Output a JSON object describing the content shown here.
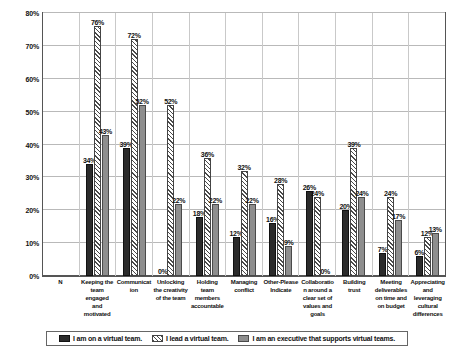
{
  "chart_data": {
    "type": "bar",
    "title": "",
    "xlabel": "",
    "ylabel": "",
    "ylim": [
      0,
      80
    ],
    "ytick_labels": [
      "0%",
      "10%",
      "20%",
      "30%",
      "40%",
      "50%",
      "60%",
      "70%",
      "80%"
    ],
    "ytick_values": [
      0,
      10,
      20,
      30,
      40,
      50,
      60,
      70,
      80
    ],
    "grid": true,
    "legend_position": "bottom",
    "value_suffix": "%",
    "categories": [
      "N",
      "Keeping the team engaged and motivated",
      "Communication",
      "Unlocking the creativity of the team",
      "Holding team members accountable",
      "Managing conflict",
      "Other-Please Indicate",
      "Collaboration around a clear set of values and goals",
      "Building trust",
      "Meeting deliverables on time and on budget",
      "Appreciating and leveraging cultural differences"
    ],
    "series": [
      {
        "name": "I am on a virtual team.",
        "pattern": "solid-dark",
        "values": [
          null,
          34,
          39,
          0,
          18,
          12,
          16,
          26,
          20,
          7,
          6
        ],
        "labels": [
          "",
          "34%",
          "39%",
          "0%",
          "18%",
          "12%",
          "16%",
          "26%",
          "20%",
          "7%",
          "6%"
        ]
      },
      {
        "name": "I lead a virtual team.",
        "pattern": "diagonal-hatch",
        "values": [
          null,
          76,
          72,
          52,
          36,
          32,
          28,
          24,
          39,
          24,
          12
        ],
        "labels": [
          "",
          "76%",
          "72%",
          "52%",
          "36%",
          "32%",
          "28%",
          "24%",
          "39%",
          "24%",
          "12%"
        ]
      },
      {
        "name": "I am an executive that supports virtual teams.",
        "pattern": "solid-gray",
        "values": [
          null,
          43,
          52,
          22,
          22,
          22,
          9,
          0,
          24,
          17,
          13
        ],
        "labels": [
          "",
          "43%",
          "52%",
          "22%",
          "22%",
          "22%",
          "9%",
          "0%",
          "24%",
          "17%",
          "13%"
        ]
      }
    ]
  },
  "legend": {
    "items": [
      {
        "label": "I am on a virtual team."
      },
      {
        "label": "I lead a virtual team."
      },
      {
        "label": "I am an executive that supports virtual teams."
      }
    ]
  }
}
